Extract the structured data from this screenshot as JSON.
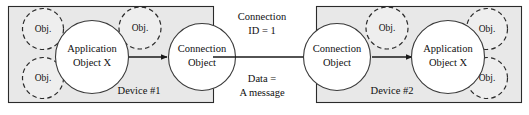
{
  "diagram": {
    "colors": {
      "device_background": "#e8e8e8",
      "device_border": "#2b2b2b",
      "circle_fill": "#ffffff",
      "circle_border": "#3a3a3a",
      "dashed_circle_fill": "#eeeeee",
      "arrow": "#1a1a1a",
      "text": "#101010",
      "page_background": "#ffffff"
    },
    "devices": [
      {
        "id": "device-1",
        "label": "Device #1",
        "nodes": [
          {
            "id": "app-object-x-left",
            "line1": "Application",
            "line2": "Object X",
            "style": "solid"
          },
          {
            "id": "connection-object-left",
            "line1": "Connection",
            "line2": "Object",
            "style": "solid"
          }
        ],
        "peripheral_objects": [
          {
            "id": "obj-left-top",
            "label": "Obj."
          },
          {
            "id": "obj-left-bottom",
            "label": "Obj."
          },
          {
            "id": "obj-left-middle-top",
            "label": "Obj."
          }
        ]
      },
      {
        "id": "device-2",
        "label": "Device #2",
        "nodes": [
          {
            "id": "connection-object-right",
            "line1": "Connection",
            "line2": "Object",
            "style": "solid"
          },
          {
            "id": "app-object-x-right",
            "line1": "Application",
            "line2": "Object X",
            "style": "solid"
          }
        ],
        "peripheral_objects": [
          {
            "id": "obj-right-middle-top",
            "label": "Obj."
          },
          {
            "id": "obj-right-top",
            "label": "Obj."
          },
          {
            "id": "obj-right-bottom",
            "label": "Obj."
          }
        ]
      }
    ],
    "link": {
      "id": "inter-device-link",
      "label_above": {
        "line1": "Connection",
        "line2": "ID = 1"
      },
      "label_below": {
        "line1": "Data =",
        "line2": "A message"
      }
    }
  }
}
